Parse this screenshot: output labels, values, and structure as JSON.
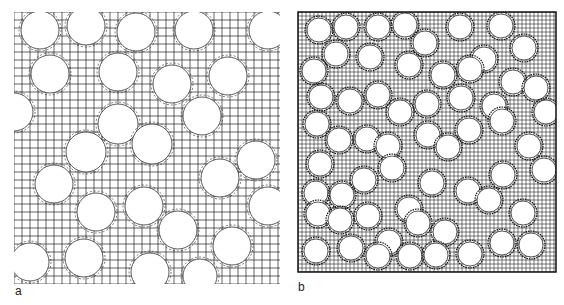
{
  "figure": {
    "panels": [
      {
        "id": "a",
        "label": "a",
        "description": "Finite element mesh of fibers in matrix, coarse grid",
        "bounds": {
          "x": 14,
          "y": 12,
          "width": 266,
          "height": 272
        },
        "grid_spacing": 8,
        "stroke": "#222222",
        "circles": [
          [
            40,
            30,
            19
          ],
          [
            86,
            26,
            19
          ],
          [
            136,
            32,
            19
          ],
          [
            194,
            30,
            19
          ],
          [
            268,
            30,
            19
          ],
          [
            50,
            74,
            19
          ],
          [
            118,
            72,
            19
          ],
          [
            172,
            84,
            19
          ],
          [
            228,
            76,
            19
          ],
          [
            14,
            112,
            19
          ],
          [
            118,
            124,
            20
          ],
          [
            202,
            116,
            19
          ],
          [
            86,
            152,
            20
          ],
          [
            152,
            144,
            20
          ],
          [
            256,
            160,
            19
          ],
          [
            54,
            184,
            19
          ],
          [
            220,
            178,
            19
          ],
          [
            268,
            206,
            19
          ],
          [
            96,
            212,
            19
          ],
          [
            144,
            206,
            19
          ],
          [
            178,
            230,
            19
          ],
          [
            232,
            246,
            19
          ],
          [
            30,
            262,
            19
          ],
          [
            84,
            258,
            19
          ],
          [
            150,
            272,
            19
          ],
          [
            200,
            276,
            17
          ]
        ]
      },
      {
        "id": "b",
        "label": "b",
        "description": "Finite element mesh of fibers in matrix, fine grid",
        "bounds": {
          "x": 298,
          "y": 12,
          "width": 258,
          "height": 260
        },
        "grid_spacing": 4,
        "stroke": "#111111",
        "circles": [
          [
            319,
            30,
            12
          ],
          [
            346,
            27,
            12
          ],
          [
            378,
            27,
            12
          ],
          [
            405,
            25,
            12
          ],
          [
            460,
            27,
            12
          ],
          [
            501,
            26,
            12
          ],
          [
            336,
            54,
            12
          ],
          [
            370,
            57,
            12
          ],
          [
            425,
            43,
            12
          ],
          [
            484,
            59,
            12
          ],
          [
            524,
            48,
            12
          ],
          [
            314,
            71,
            12
          ],
          [
            409,
            65,
            12
          ],
          [
            443,
            75,
            12
          ],
          [
            470,
            69,
            12
          ],
          [
            513,
            82,
            12
          ],
          [
            536,
            88,
            12
          ],
          [
            321,
            97,
            12
          ],
          [
            350,
            101,
            12
          ],
          [
            378,
            95,
            12
          ],
          [
            400,
            112,
            12
          ],
          [
            427,
            104,
            12
          ],
          [
            461,
            98,
            12
          ],
          [
            494,
            106,
            12
          ],
          [
            546,
            112,
            12
          ],
          [
            317,
            124,
            12
          ],
          [
            339,
            140,
            12
          ],
          [
            367,
            139,
            12
          ],
          [
            428,
            135,
            12
          ],
          [
            469,
            130,
            12
          ],
          [
            502,
            121,
            12
          ],
          [
            320,
            164,
            12
          ],
          [
            388,
            146,
            12
          ],
          [
            448,
            147,
            12
          ],
          [
            529,
            146,
            12
          ],
          [
            316,
            193,
            12
          ],
          [
            342,
            195,
            12
          ],
          [
            364,
            180,
            12
          ],
          [
            392,
            168,
            12
          ],
          [
            432,
            183,
            12
          ],
          [
            468,
            191,
            12
          ],
          [
            503,
            175,
            12
          ],
          [
            544,
            170,
            12
          ],
          [
            318,
            214,
            12
          ],
          [
            340,
            220,
            12
          ],
          [
            368,
            216,
            12
          ],
          [
            409,
            209,
            12
          ],
          [
            489,
            200,
            12
          ],
          [
            523,
            213,
            12
          ],
          [
            316,
            251,
            12
          ],
          [
            351,
            248,
            12
          ],
          [
            389,
            242,
            12
          ],
          [
            418,
            223,
            12
          ],
          [
            445,
            232,
            12
          ],
          [
            470,
            254,
            12
          ],
          [
            502,
            243,
            12
          ],
          [
            531,
            245,
            12
          ],
          [
            378,
            256,
            12
          ],
          [
            410,
            256,
            12
          ],
          [
            436,
            255,
            12
          ]
        ]
      }
    ]
  }
}
